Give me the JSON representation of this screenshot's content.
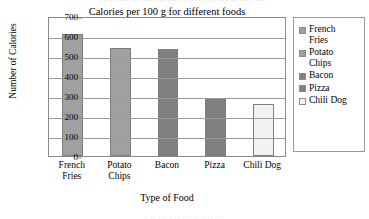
{
  "bleed": {
    "top_text": "· ·  ·· ··· ·· ···· ··· ··· ·· ·  ··  · ·· ··· ·· ···· ··· ·",
    "bottom_text": "· ··   ···    · ·· ··· ·· ···· ···"
  },
  "chart_data": {
    "type": "bar",
    "title": "Calories per 100 g for different foods",
    "xlabel": "Type of Food",
    "ylabel": "Number of Calories",
    "categories": [
      "French Fries",
      "Potato Chips",
      "Bacon",
      "Pizza",
      "Chili Dog"
    ],
    "category_labels": [
      "French\nFries",
      "Potato\nChips",
      "Bacon",
      "Pizza",
      "Chili Dog"
    ],
    "values": [
      610,
      540,
      535,
      290,
      260
    ],
    "ylim": [
      0,
      700
    ],
    "yticks": [
      0,
      100,
      200,
      300,
      400,
      500,
      600,
      700
    ],
    "ytick_labels": [
      "0",
      "100",
      "200",
      "300",
      "400",
      "500",
      "600",
      "700"
    ],
    "grid": true,
    "legend_position": "right",
    "legend_entries": [
      "French Fries",
      "Potato Chips",
      "Bacon",
      "Pizza",
      "Chili Dog"
    ],
    "bar_colors": [
      "#a0a0a0",
      "#a0a0a0",
      "#808080",
      "#808080",
      "#f2f2f2"
    ],
    "frame_color": "#8a8a8a",
    "gridline_color": "#9a9a9a"
  }
}
